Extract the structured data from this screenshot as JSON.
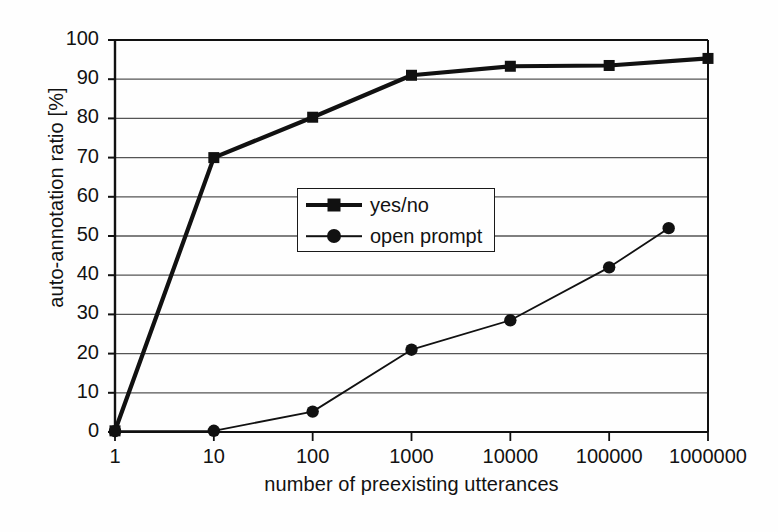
{
  "chart_data": {
    "type": "line",
    "title": "",
    "xlabel": "number of preexisting utterances",
    "ylabel": "auto-annotation ratio [%]",
    "x_scale": "log",
    "xlim": [
      1,
      1000000
    ],
    "ylim": [
      0,
      100
    ],
    "grid": "horizontal",
    "legend_position": "center",
    "x_tick_labels": [
      "1",
      "10",
      "100",
      "1000",
      "10000",
      "100000",
      "1000000"
    ],
    "x_tick_values": [
      1,
      10,
      100,
      1000,
      10000,
      100000,
      1000000
    ],
    "y_tick_labels": [
      "0",
      "10",
      "20",
      "30",
      "40",
      "50",
      "60",
      "70",
      "80",
      "90",
      "100"
    ],
    "y_tick_values": [
      0,
      10,
      20,
      30,
      40,
      50,
      60,
      70,
      80,
      90,
      100
    ],
    "series": [
      {
        "name": "yes/no",
        "marker": "square",
        "line_width": "thick",
        "color": "#111111",
        "x": [
          1,
          10,
          100,
          1000,
          10000,
          100000,
          1000000
        ],
        "values": [
          0.3,
          70.0,
          80.3,
          91.0,
          93.3,
          93.5,
          95.3
        ]
      },
      {
        "name": "open prompt",
        "marker": "circle",
        "line_width": "thin",
        "color": "#111111",
        "x": [
          1,
          10,
          100,
          1000,
          10000,
          100000,
          400000
        ],
        "values": [
          0.2,
          0.3,
          5.2,
          21.0,
          28.5,
          42.0,
          52.0
        ]
      }
    ]
  },
  "legend": {
    "entries": [
      {
        "label": "yes/no"
      },
      {
        "label": "open prompt"
      }
    ]
  },
  "axes": {
    "y_title": "auto-annotation ratio [%]",
    "x_title": "number of preexisting utterances"
  },
  "colors": {
    "ink": "#111111",
    "grid": "#555555",
    "background": "#fefefe"
  }
}
